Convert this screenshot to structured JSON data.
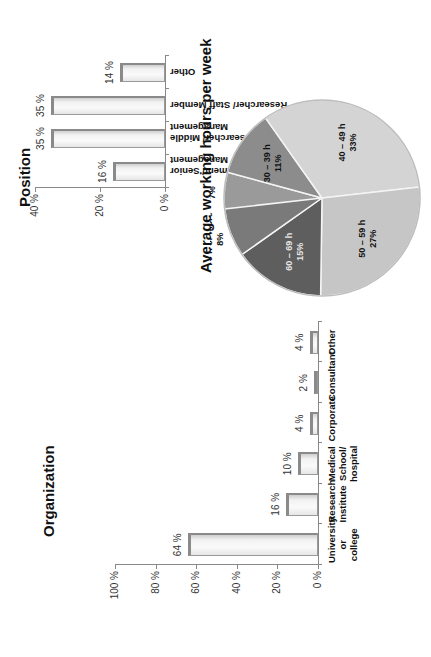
{
  "chart_data": [
    {
      "type": "bar",
      "title": "Organization",
      "categories": [
        "University or college",
        "Research Institute",
        "Medical School/ hospital",
        "Corporate",
        "Consultant",
        "Other"
      ],
      "values": [
        64,
        16,
        10,
        4,
        2,
        4
      ],
      "value_labels": [
        "64 %",
        "16 %",
        "10 %",
        "4 %",
        "2 %",
        "4 %"
      ],
      "xlabel": "",
      "ylabel": "",
      "ylim": [
        0,
        100
      ],
      "yticks": [
        "0 %",
        "20 %",
        "40 %",
        "60 %",
        "80 %",
        "100 %"
      ],
      "grid": false,
      "orientation": "vertical (page rotated 90° CCW)"
    },
    {
      "type": "bar",
      "title": "Position",
      "categories": [
        "Head of Department/ Senior Management",
        "Senior Researcher/ Middle Management",
        "Researcher/ Staff Member",
        "Other"
      ],
      "values": [
        16,
        35,
        35,
        14
      ],
      "value_labels": [
        "16 %",
        "35 %",
        "35 %",
        "14 %"
      ],
      "xlabel": "",
      "ylabel": "",
      "ylim": [
        0,
        40
      ],
      "yticks": [
        "0 %",
        "20 %",
        "40 %"
      ],
      "grid": false,
      "orientation": "vertical (page rotated 90° CCW)"
    },
    {
      "type": "pie",
      "title": "Average working hours per week",
      "categories": [
        "0 – 29 h",
        "30 – 39 h",
        "40 – 49 h",
        "50 – 59 h",
        "60 – 69 h",
        "70 h or more"
      ],
      "values": [
        7,
        11,
        33,
        27,
        15,
        8
      ],
      "value_labels": [
        "7%",
        "11%",
        "33%",
        "27%",
        "15%",
        "8%"
      ],
      "colors": [
        "#9a9a9a",
        "#8c8c8c",
        "#d4d4d4",
        "#c6c6c6",
        "#5e5e5e",
        "#7a7a7a"
      ],
      "legend": "none (labels on slices)"
    }
  ],
  "labels": {
    "org_title": "Organization",
    "pos_title": "Position",
    "pie_title": "Average working hours per week"
  }
}
